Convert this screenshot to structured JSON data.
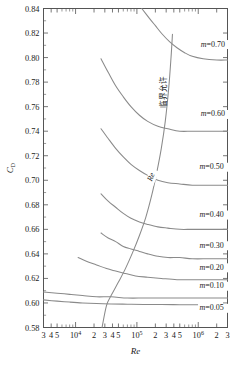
{
  "chart_data": {
    "type": "line",
    "title": "",
    "xlabel": "Re",
    "ylabel": "C_D",
    "xscale": "log",
    "xlim": [
      3000,
      3000000
    ],
    "ylim": [
      0.58,
      0.84
    ],
    "grid": false,
    "legend_position": "inline-right",
    "y_ticks": [
      "0.58",
      "0.60",
      "0.62",
      "0.64",
      "0.66",
      "0.68",
      "0.70",
      "0.72",
      "0.74",
      "0.76",
      "0.78",
      "0.80",
      "0.82",
      "0.84"
    ],
    "y_tick_values": [
      0.58,
      0.6,
      0.62,
      0.64,
      0.66,
      0.68,
      0.7,
      0.72,
      0.74,
      0.76,
      0.78,
      0.8,
      0.82,
      0.84
    ],
    "x_tick_labels": [
      "3",
      "4",
      "5",
      "10^4",
      "2",
      "3",
      "4",
      "5",
      "10^5",
      "2",
      "3",
      "4",
      "5",
      "10^6",
      "2",
      "3"
    ],
    "x_tick_values": [
      3000,
      4000,
      5000,
      10000,
      20000,
      30000,
      40000,
      50000,
      100000,
      200000,
      300000,
      400000,
      500000,
      1000000,
      2000000,
      3000000
    ],
    "series": [
      {
        "name": "m=0.70",
        "label": "m=0.70",
        "m": 0.7,
        "label_x": 1100000,
        "label_y": 0.809,
        "points": [
          [
            120000,
            0.84
          ],
          [
            160000,
            0.832
          ],
          [
            200000,
            0.826
          ],
          [
            260000,
            0.819
          ],
          [
            340000,
            0.813
          ],
          [
            450000,
            0.808
          ],
          [
            600000,
            0.804
          ],
          [
            800000,
            0.801
          ],
          [
            1200000,
            0.799
          ],
          [
            2000000,
            0.798
          ],
          [
            3000000,
            0.798
          ]
        ]
      },
      {
        "name": "m=0.60",
        "label": "m=0.60",
        "m": 0.6,
        "label_x": 1100000,
        "label_y": 0.752,
        "points": [
          [
            26000,
            0.799
          ],
          [
            34000,
            0.788
          ],
          [
            45000,
            0.777
          ],
          [
            60000,
            0.768
          ],
          [
            80000,
            0.76
          ],
          [
            110000,
            0.753
          ],
          [
            150000,
            0.748
          ],
          [
            220000,
            0.744
          ],
          [
            320000,
            0.742
          ],
          [
            500000,
            0.74
          ],
          [
            800000,
            0.74
          ],
          [
            1500000,
            0.74
          ],
          [
            3000000,
            0.74
          ]
        ]
      },
      {
        "name": "m=0.50",
        "label": "m=0.50",
        "m": 0.5,
        "label_x": 1050000,
        "label_y": 0.709,
        "points": [
          [
            26000,
            0.742
          ],
          [
            34000,
            0.734
          ],
          [
            45000,
            0.726
          ],
          [
            60000,
            0.719
          ],
          [
            80000,
            0.713
          ],
          [
            110000,
            0.708
          ],
          [
            150000,
            0.704
          ],
          [
            220000,
            0.7
          ],
          [
            320000,
            0.698
          ],
          [
            500000,
            0.697
          ],
          [
            800000,
            0.696
          ],
          [
            1500000,
            0.696
          ],
          [
            3000000,
            0.696
          ]
        ]
      },
      {
        "name": "m=0.40",
        "label": "m=0.40",
        "m": 0.4,
        "label_x": 1050000,
        "label_y": 0.67,
        "points": [
          [
            26000,
            0.689
          ],
          [
            34000,
            0.683
          ],
          [
            45000,
            0.678
          ],
          [
            60000,
            0.673
          ],
          [
            80000,
            0.669
          ],
          [
            110000,
            0.666
          ],
          [
            150000,
            0.664
          ],
          [
            220000,
            0.662
          ],
          [
            320000,
            0.661
          ],
          [
            500000,
            0.66
          ],
          [
            800000,
            0.66
          ],
          [
            1500000,
            0.66
          ],
          [
            3000000,
            0.66
          ]
        ]
      },
      {
        "name": "m=0.30",
        "label": "m=0.30",
        "m": 0.3,
        "label_x": 1050000,
        "label_y": 0.645,
        "points": [
          [
            26000,
            0.657
          ],
          [
            34000,
            0.653
          ],
          [
            45000,
            0.65
          ],
          [
            60000,
            0.646
          ],
          [
            80000,
            0.644
          ],
          [
            110000,
            0.642
          ],
          [
            150000,
            0.64
          ],
          [
            220000,
            0.638
          ],
          [
            320000,
            0.637
          ],
          [
            500000,
            0.637
          ],
          [
            800000,
            0.636
          ],
          [
            1500000,
            0.636
          ],
          [
            3000000,
            0.636
          ]
        ]
      },
      {
        "name": "m=0.20",
        "label": "m=0.20",
        "m": 0.2,
        "label_x": 1050000,
        "label_y": 0.627,
        "points": [
          [
            11000,
            0.637
          ],
          [
            15000,
            0.634
          ],
          [
            22000,
            0.631
          ],
          [
            32000,
            0.628
          ],
          [
            45000,
            0.626
          ],
          [
            65000,
            0.624
          ],
          [
            95000,
            0.622
          ],
          [
            150000,
            0.621
          ],
          [
            250000,
            0.62
          ],
          [
            450000,
            0.619
          ],
          [
            800000,
            0.619
          ],
          [
            1500000,
            0.619
          ],
          [
            3000000,
            0.619
          ]
        ]
      },
      {
        "name": "m=0.10",
        "label": "m=0.10",
        "m": 0.1,
        "label_x": 1050000,
        "label_y": 0.612,
        "points": [
          [
            3000,
            0.609
          ],
          [
            5000,
            0.608
          ],
          [
            8000,
            0.607
          ],
          [
            13000,
            0.606
          ],
          [
            22000,
            0.605
          ],
          [
            38000,
            0.605
          ],
          [
            70000,
            0.604
          ],
          [
            130000,
            0.604
          ],
          [
            250000,
            0.604
          ],
          [
            500000,
            0.604
          ],
          [
            1000000,
            0.604
          ],
          [
            3000000,
            0.604
          ]
        ]
      },
      {
        "name": "m=0.05",
        "label": "m=0.05",
        "m": 0.05,
        "label_x": 1050000,
        "label_y": 0.594,
        "points": [
          [
            3000,
            0.6025
          ],
          [
            5000,
            0.6015
          ],
          [
            8000,
            0.6007
          ],
          [
            13000,
            0.6
          ],
          [
            22000,
            0.5995
          ],
          [
            38000,
            0.5992
          ],
          [
            70000,
            0.599
          ],
          [
            130000,
            0.5988
          ],
          [
            250000,
            0.5987
          ],
          [
            500000,
            0.5986
          ],
          [
            1000000,
            0.5986
          ],
          [
            3000000,
            0.5986
          ]
        ]
      }
    ],
    "critical_curve": {
      "name": "critical-limit-curve",
      "label": "Re",
      "annotation": "临界允许",
      "points": [
        [
          27000,
          0.58
        ],
        [
          32000,
          0.598
        ],
        [
          38000,
          0.606
        ],
        [
          50000,
          0.617
        ],
        [
          65000,
          0.628
        ],
        [
          85000,
          0.641
        ],
        [
          110000,
          0.655
        ],
        [
          140000,
          0.67
        ],
        [
          175000,
          0.688
        ],
        [
          210000,
          0.706
        ],
        [
          250000,
          0.726
        ],
        [
          290000,
          0.748
        ],
        [
          330000,
          0.775
        ],
        [
          360000,
          0.8
        ],
        [
          380000,
          0.819
        ]
      ],
      "label_x": 185000,
      "label_y": 0.702,
      "annotation_x": 300000,
      "annotation_y": 0.772
    }
  },
  "axes": {
    "y_title": "C",
    "y_title_sub": "D",
    "x_title": "Re"
  },
  "colors": {
    "curve": "#8a8a8a",
    "axis": "#555555",
    "text": "#1a1a1a",
    "background": "#ffffff"
  }
}
